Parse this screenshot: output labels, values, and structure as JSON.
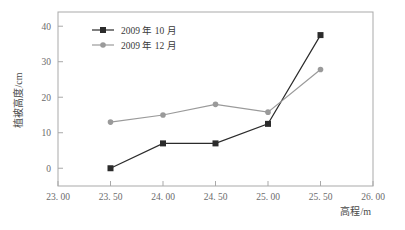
{
  "chart_data": {
    "type": "line",
    "title": "",
    "xlabel": "高程/m",
    "ylabel": "植被高度/cm",
    "x": [
      23.5,
      24.0,
      24.5,
      25.0,
      25.5
    ],
    "xlim": [
      23.0,
      26.0
    ],
    "ylim": [
      -5,
      44
    ],
    "xticks": [
      23.0,
      23.5,
      24.0,
      24.5,
      25.0,
      25.5,
      26.0
    ],
    "xtick_labels": [
      "23. 00",
      "23. 50",
      "24. 00",
      "24. 50",
      "25. 00",
      "25. 50",
      "26. 00"
    ],
    "yticks": [
      0,
      10,
      20,
      30,
      40
    ],
    "ytick_labels": [
      "0",
      "10",
      "20",
      "30",
      "40"
    ],
    "grid": false,
    "legend_position": "top-left",
    "series": [
      {
        "name": "2009 年 10 月",
        "marker": "square",
        "color": "#2b2b2b",
        "values": [
          0,
          7,
          7,
          12.5,
          37.5
        ]
      },
      {
        "name": "2009 年 12 月",
        "marker": "circle",
        "color": "#9a9a9a",
        "values": [
          13,
          15,
          18,
          15.8,
          27.8
        ]
      }
    ]
  },
  "legend": {
    "entries": [
      {
        "label": "2009 年 10 月"
      },
      {
        "label": "2009 年 12 月"
      }
    ]
  },
  "axes": {
    "x_title": "高程/m",
    "y_title": "植被高度/cm"
  },
  "colors": {
    "series1": "#2b2b2b",
    "series2": "#9a9a9a",
    "frame": "#a9a9a9",
    "text": "#4a4a4a",
    "background": "#ffffff"
  }
}
